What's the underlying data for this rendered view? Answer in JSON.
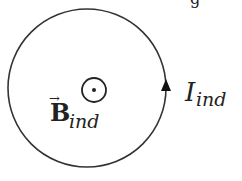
{
  "diagram": {
    "title_partial": "g",
    "loop": {
      "cx": 87,
      "cy": 88,
      "r": 79,
      "stroke": "#333333"
    },
    "field": {
      "symbol": "out-of-page-dot",
      "vector_symbol": "B",
      "subscript": "ind",
      "arrow": "→"
    },
    "current": {
      "symbol": "I",
      "subscript": "ind",
      "direction": "counterclockwise (up on right side)"
    }
  }
}
